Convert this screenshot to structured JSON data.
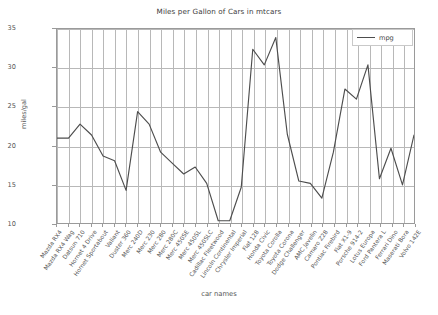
{
  "chart_data": {
    "type": "line",
    "title": "Miles per Gallon of Cars in mtcars",
    "xlabel": "car names",
    "ylabel": "miles/gal",
    "grid": true,
    "legend_position": "upper right",
    "ylim": [
      10,
      35
    ],
    "yticks": [
      10,
      15,
      20,
      25,
      30,
      35
    ],
    "ytick_labels": [
      "10",
      "15",
      "20",
      "25",
      "30",
      "35"
    ],
    "categories": [
      "Mazda RX4",
      "Mazda RX4 Wag",
      "Datsun 710",
      "Hornet 4 Drive",
      "Hornet Sportabout",
      "Valiant",
      "Duster 360",
      "Merc 240D",
      "Merc 230",
      "Merc 280",
      "Merc 280C",
      "Merc 450SE",
      "Merc 450SL",
      "Merc 450SLC",
      "Cadillac Fleetwood",
      "Lincoln Continental",
      "Chrysler Imperial",
      "Fiat 128",
      "Honda Civic",
      "Toyota Corolla",
      "Toyota Corona",
      "Dodge Challenger",
      "AMC Javelin",
      "Camaro Z28",
      "Pontiac Firebird",
      "Fiat X1-9",
      "Porsche 914-2",
      "Lotus Europa",
      "Ford Pantera L",
      "Ferrari Dino",
      "Maserati Bora",
      "Volvo 142E"
    ],
    "series": [
      {
        "name": "mpg",
        "color": "#4d4d4d",
        "values": [
          21.0,
          21.0,
          22.8,
          21.4,
          18.7,
          18.1,
          14.3,
          24.4,
          22.8,
          19.2,
          17.8,
          16.4,
          17.3,
          15.2,
          10.4,
          10.4,
          14.7,
          32.4,
          30.4,
          33.9,
          21.5,
          15.5,
          15.2,
          13.3,
          19.2,
          27.3,
          26.0,
          30.4,
          15.8,
          19.7,
          15.0,
          21.4
        ]
      }
    ]
  },
  "legend": {
    "entries": [
      {
        "label": "mpg"
      }
    ]
  }
}
